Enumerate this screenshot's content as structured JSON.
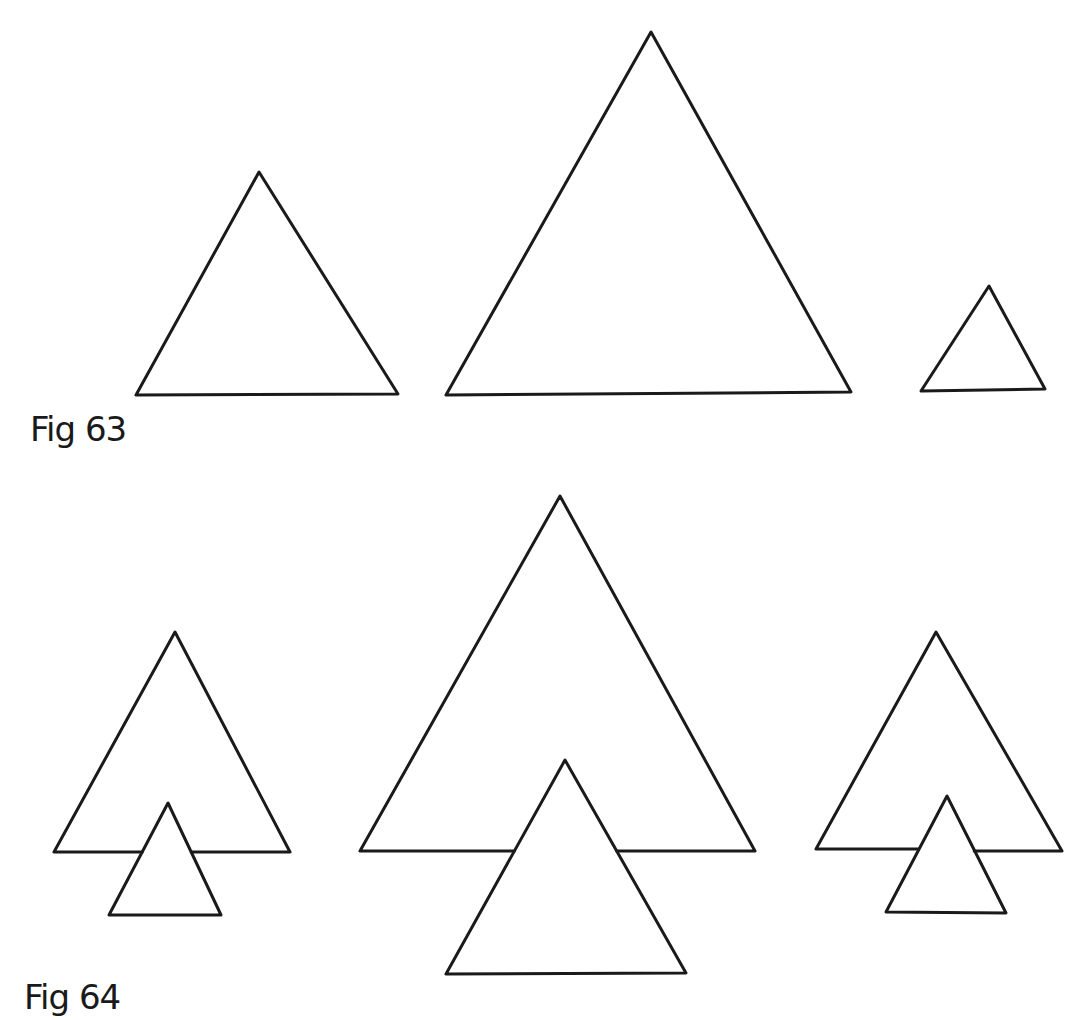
{
  "figures": [
    {
      "label": "Fig 63",
      "stroke": "#1a1a1a",
      "triangles": [
        {
          "name": "medium",
          "points": [
            [
              259,
              172
            ],
            [
              136,
              395
            ],
            [
              398,
              394
            ]
          ]
        },
        {
          "name": "large",
          "points": [
            [
              651,
              32
            ],
            [
              446,
              395
            ],
            [
              851,
              392
            ]
          ]
        },
        {
          "name": "small",
          "points": [
            [
              989,
              286
            ],
            [
              921,
              391
            ],
            [
              1045,
              389
            ]
          ]
        }
      ]
    },
    {
      "label": "Fig 64",
      "stroke": "#1a1a1a",
      "groups": [
        {
          "name": "group-left",
          "outer": {
            "apex": [
              175,
              632
            ],
            "base_left": [
              54,
              852
            ],
            "base_right": [
              290,
              852
            ]
          },
          "inner": {
            "points": [
              [
                168,
                803
              ],
              [
                109,
                915
              ],
              [
                221,
                915
              ]
            ]
          }
        },
        {
          "name": "group-center",
          "outer": {
            "apex": [
              560,
              496
            ],
            "base_left": [
              360,
              851
            ],
            "base_right": [
              755,
              851
            ]
          },
          "inner": {
            "points": [
              [
                565,
                760
              ],
              [
                446,
                974
              ],
              [
                686,
                973
              ]
            ]
          }
        },
        {
          "name": "group-right",
          "outer": {
            "apex": [
              936,
              632
            ],
            "base_left": [
              816,
              849
            ],
            "base_right": [
              1062,
              851
            ]
          },
          "inner": {
            "points": [
              [
                947,
                796
              ],
              [
                886,
                912
              ],
              [
                1006,
                913
              ]
            ]
          }
        }
      ]
    }
  ]
}
